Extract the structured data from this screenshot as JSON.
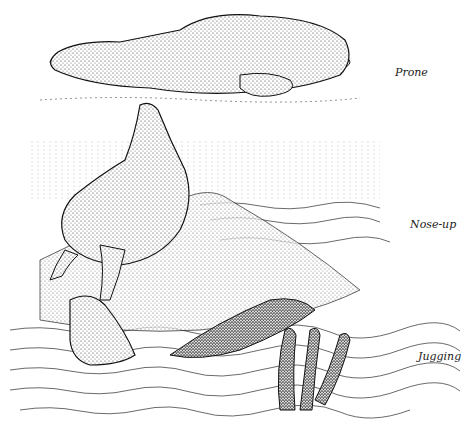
{
  "figure": {
    "labels": [
      {
        "id": "prone",
        "text": "Prone"
      },
      {
        "id": "nose-up",
        "text": "Nose-up"
      },
      {
        "id": "jugging",
        "text": "Jugging"
      }
    ]
  }
}
